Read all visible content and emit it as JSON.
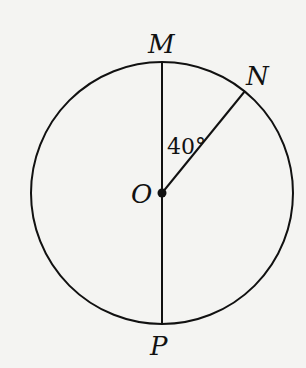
{
  "diagram": {
    "type": "circle-geometry",
    "center": {
      "label": "O",
      "x": 162,
      "y": 193
    },
    "radius": 131,
    "points": [
      {
        "label": "M",
        "x": 162,
        "y": 61,
        "label_x": 148,
        "label_y": 52
      },
      {
        "label": "N",
        "x": 245,
        "y": 91,
        "label_x": 246,
        "label_y": 85
      },
      {
        "label": "P",
        "x": 162,
        "y": 325,
        "label_x": 150,
        "label_y": 355
      }
    ],
    "segments": [
      {
        "from": "M",
        "to": "P",
        "note": "diameter"
      },
      {
        "from": "O",
        "to": "N",
        "note": "radius"
      }
    ],
    "angle": {
      "label": "40°",
      "between": [
        "OM",
        "ON"
      ],
      "value_deg": 40
    },
    "stroke_color": "#111111",
    "background_color": "#f4f4f2"
  }
}
